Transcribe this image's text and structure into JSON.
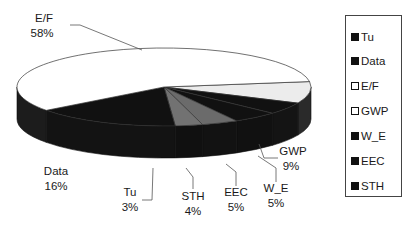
{
  "chart_data": {
    "type": "pie",
    "style": "3d",
    "title": "",
    "slices": [
      {
        "name": "E/F",
        "value": 58,
        "label": "E/F",
        "pct": "58%",
        "color": "#ffffff"
      },
      {
        "name": "GWP",
        "value": 9,
        "label": "GWP",
        "pct": "9%",
        "color": "#eeeeee"
      },
      {
        "name": "W_E",
        "value": 5,
        "label": "W_E",
        "pct": "5%",
        "color": "#111111"
      },
      {
        "name": "EEC",
        "value": 5,
        "label": "EEC",
        "pct": "5%",
        "color": "#111111"
      },
      {
        "name": "STH",
        "value": 4,
        "label": "STH",
        "pct": "4%",
        "color": "#6a6a6a"
      },
      {
        "name": "Tu",
        "value": 3,
        "label": "Tu",
        "pct": "3%",
        "color": "#707070"
      },
      {
        "name": "Data",
        "value": 16,
        "label": "Data",
        "pct": "16%",
        "color": "#111111"
      }
    ],
    "legend": {
      "placement": "right",
      "entries": [
        {
          "label": "Tu",
          "color": "#111111"
        },
        {
          "label": "Data",
          "color": "#111111"
        },
        {
          "label": "E/F",
          "color": "#ffffff"
        },
        {
          "label": "GWP",
          "color": "#ffffff"
        },
        {
          "label": "W_E",
          "color": "#111111"
        },
        {
          "label": "EEC",
          "color": "#111111"
        },
        {
          "label": "STH",
          "color": "#111111"
        }
      ]
    }
  }
}
